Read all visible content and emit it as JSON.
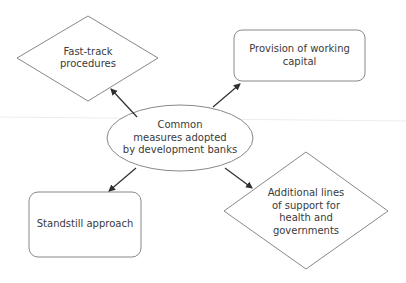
{
  "diagram": {
    "title": "Common measures adopted by development banks",
    "colors": {
      "stroke": "#7a7a7a",
      "arrow": "#2f2f2f",
      "text": "#3a3a3a",
      "background": "#ffffff"
    },
    "center": {
      "shape": "ellipse",
      "lines": [
        "Common",
        "measures adopted",
        "by development banks"
      ]
    },
    "nodes": [
      {
        "id": "fast-track",
        "shape": "diamond",
        "position": "top-left",
        "lines": [
          "Fast-track",
          "procedures"
        ]
      },
      {
        "id": "working-capital",
        "shape": "rounded-rectangle",
        "position": "top-right",
        "lines": [
          "Provision of working",
          "capital"
        ]
      },
      {
        "id": "standstill",
        "shape": "rounded-rectangle",
        "position": "bottom-left",
        "lines": [
          "Standstill approach"
        ]
      },
      {
        "id": "additional-lines",
        "shape": "diamond",
        "position": "bottom-right",
        "lines": [
          "Additional lines",
          "of support for",
          "health and",
          "governments"
        ]
      }
    ],
    "edges": [
      {
        "from": "center",
        "to": "fast-track"
      },
      {
        "from": "center",
        "to": "working-capital"
      },
      {
        "from": "center",
        "to": "standstill"
      },
      {
        "from": "center",
        "to": "additional-lines"
      }
    ]
  }
}
